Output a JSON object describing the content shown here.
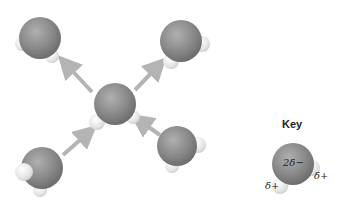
{
  "diagram": {
    "molecules": [
      {
        "id": "top-left",
        "cx": 40,
        "cy": 38
      },
      {
        "id": "top-right",
        "cx": 180,
        "cy": 40
      },
      {
        "id": "center",
        "cx": 112,
        "cy": 105
      },
      {
        "id": "bottom-right",
        "cx": 176,
        "cy": 145
      },
      {
        "id": "bottom-left",
        "cx": 40,
        "cy": 168
      }
    ],
    "arrows": [
      {
        "from": "center",
        "to": "top-left"
      },
      {
        "from": "center",
        "to": "top-right"
      },
      {
        "from": "bottom-left",
        "to": "center"
      },
      {
        "from": "bottom-right",
        "to": "center"
      }
    ],
    "colors": {
      "oxygen": "#8c8c8c",
      "hydrogen": "#e8e8e8",
      "arrow": "#b4b4b4"
    }
  },
  "key": {
    "title": "Key",
    "oxygen_charge": "2δ−",
    "hydrogen_charge_left": "δ+",
    "hydrogen_charge_right": "δ+"
  }
}
